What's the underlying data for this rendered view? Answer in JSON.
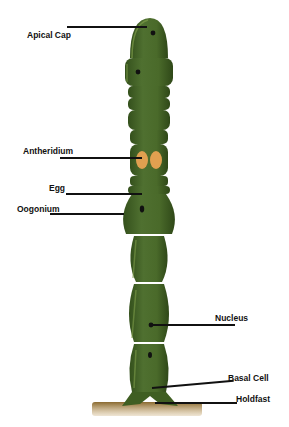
{
  "diagram": {
    "labels": {
      "apical_cap": "Apical Cap",
      "antheridium": "Antheridium",
      "egg": "Egg",
      "oogonium": "Oogonium",
      "nucleus": "Nucleus",
      "basal_cell": "Basal Cell",
      "holdfast": "Holdfast"
    },
    "colors": {
      "filament": "#4a6a2a",
      "filament_dark": "#34501c",
      "highlight": "#7d9c4a",
      "antheridium": "#e0a050",
      "nucleus": "#111111",
      "substrate": "#a07838"
    }
  }
}
